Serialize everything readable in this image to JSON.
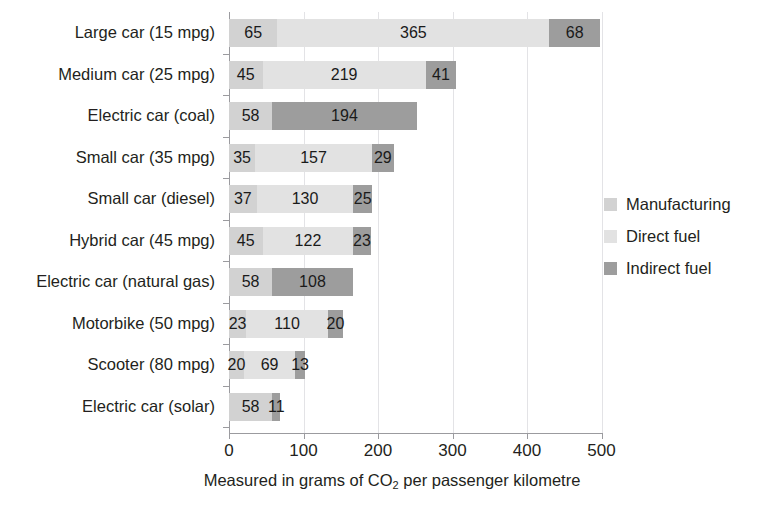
{
  "title_strip": {
    "left_fragment": "",
    "right_fragment": ""
  },
  "legend": {
    "position": "right",
    "items": [
      {
        "label": "Manufacturing",
        "color": "#d2d2d2",
        "icon": "legend-swatch-icon"
      },
      {
        "label": "Direct fuel",
        "color": "#e2e2e2",
        "icon": "legend-swatch-icon"
      },
      {
        "label": "Indirect fuel",
        "color": "#9d9d9d",
        "icon": "legend-swatch-icon"
      }
    ]
  },
  "axis": {
    "x_title_prefix": "Measured in grams of CO",
    "x_title_sub": "2",
    "x_title_suffix": " per passenger kilometre",
    "x_ticks": [
      "0",
      "100",
      "200",
      "300",
      "400",
      "500"
    ]
  },
  "chart_data": {
    "type": "bar",
    "orientation": "horizontal",
    "stacked": true,
    "title": "",
    "xlabel": "Measured in grams of CO2 per passenger kilometre",
    "ylabel": "",
    "xlim": [
      0,
      500
    ],
    "xticks": [
      0,
      100,
      200,
      300,
      400,
      500
    ],
    "grid": "vertical",
    "legend_position": "right",
    "colors": {
      "Manufacturing": "#d2d2d2",
      "Direct fuel": "#e2e2e2",
      "Indirect fuel": "#9d9d9d"
    },
    "categories": [
      "Large car (15 mpg)",
      "Medium car (25 mpg)",
      "Electric car (coal)",
      "Small car (35 mpg)",
      "Small car (diesel)",
      "Hybrid car (45 mpg)",
      "Electric car (natural gas)",
      "Motorbike (50 mpg)",
      "Scooter (80 mpg)",
      "Electric car (solar)"
    ],
    "series": [
      {
        "name": "Manufacturing",
        "values": [
          65,
          45,
          58,
          35,
          37,
          45,
          58,
          23,
          20,
          58
        ]
      },
      {
        "name": "Direct fuel",
        "values": [
          365,
          219,
          0,
          157,
          130,
          122,
          0,
          110,
          69,
          0
        ]
      },
      {
        "name": "Indirect fuel",
        "values": [
          68,
          41,
          194,
          29,
          25,
          23,
          108,
          20,
          13,
          11
        ]
      }
    ],
    "totals": [
      498,
      305,
      252,
      221,
      192,
      190,
      166,
      153,
      102,
      69
    ],
    "rows": [
      {
        "category": "Large car (15 mpg)",
        "segments": [
          {
            "series": "Manufacturing",
            "value": 65,
            "label": "65"
          },
          {
            "series": "Direct fuel",
            "value": 365,
            "label": "365"
          },
          {
            "series": "Indirect fuel",
            "value": 68,
            "label": "68"
          }
        ]
      },
      {
        "category": "Medium car (25 mpg)",
        "segments": [
          {
            "series": "Manufacturing",
            "value": 45,
            "label": "45"
          },
          {
            "series": "Direct fuel",
            "value": 219,
            "label": "219"
          },
          {
            "series": "Indirect fuel",
            "value": 41,
            "label": "41"
          }
        ]
      },
      {
        "category": "Electric car (coal)",
        "segments": [
          {
            "series": "Manufacturing",
            "value": 58,
            "label": "58"
          },
          {
            "series": "Indirect fuel",
            "value": 194,
            "label": "194"
          }
        ]
      },
      {
        "category": "Small car (35 mpg)",
        "segments": [
          {
            "series": "Manufacturing",
            "value": 35,
            "label": "35"
          },
          {
            "series": "Direct fuel",
            "value": 157,
            "label": "157"
          },
          {
            "series": "Indirect fuel",
            "value": 29,
            "label": "29"
          }
        ]
      },
      {
        "category": "Small car (diesel)",
        "segments": [
          {
            "series": "Manufacturing",
            "value": 37,
            "label": "37"
          },
          {
            "series": "Direct fuel",
            "value": 130,
            "label": "130"
          },
          {
            "series": "Indirect fuel",
            "value": 25,
            "label": "25"
          }
        ]
      },
      {
        "category": "Hybrid car (45 mpg)",
        "segments": [
          {
            "series": "Manufacturing",
            "value": 45,
            "label": "45"
          },
          {
            "series": "Direct fuel",
            "value": 122,
            "label": "122"
          },
          {
            "series": "Indirect fuel",
            "value": 23,
            "label": "23"
          }
        ]
      },
      {
        "category": "Electric car (natural gas)",
        "segments": [
          {
            "series": "Manufacturing",
            "value": 58,
            "label": "58"
          },
          {
            "series": "Indirect fuel",
            "value": 108,
            "label": "108"
          }
        ]
      },
      {
        "category": "Motorbike (50 mpg)",
        "segments": [
          {
            "series": "Manufacturing",
            "value": 23,
            "label": "23"
          },
          {
            "series": "Direct fuel",
            "value": 110,
            "label": "110"
          },
          {
            "series": "Indirect fuel",
            "value": 20,
            "label": "20"
          }
        ]
      },
      {
        "category": "Scooter (80 mpg)",
        "segments": [
          {
            "series": "Manufacturing",
            "value": 20,
            "label": "20"
          },
          {
            "series": "Direct fuel",
            "value": 69,
            "label": "69"
          },
          {
            "series": "Indirect fuel",
            "value": 13,
            "label": "13"
          }
        ]
      },
      {
        "category": "Electric car (solar)",
        "segments": [
          {
            "series": "Manufacturing",
            "value": 58,
            "label": "58"
          },
          {
            "series": "Indirect fuel",
            "value": 11,
            "label": "11"
          }
        ]
      }
    ]
  }
}
